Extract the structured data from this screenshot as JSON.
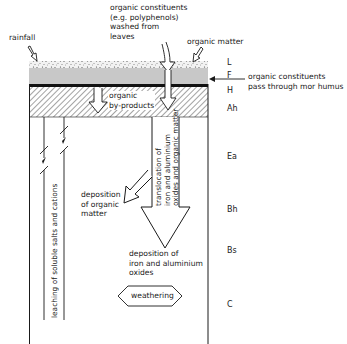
{
  "diagram": {
    "inputs": {
      "rainfall": "rainfall",
      "organic_constituents": [
        "organic constituents",
        "(e.g. polyphenols)",
        "washed from",
        "leaves"
      ],
      "organic_matter": "organic matter"
    },
    "side_note": [
      "organic constituents",
      "pass through mor humus"
    ],
    "horizons": [
      {
        "id": "L",
        "label": "L"
      },
      {
        "id": "F",
        "label": "F"
      },
      {
        "id": "H",
        "label": "H"
      },
      {
        "id": "Ah",
        "label": "Ah"
      },
      {
        "id": "Ea",
        "label": "Ea"
      },
      {
        "id": "Bh",
        "label": "Bh"
      },
      {
        "id": "Bs",
        "label": "Bs"
      },
      {
        "id": "C",
        "label": "C"
      }
    ],
    "processes": {
      "organic_byproducts": [
        "organic",
        "by-products"
      ],
      "leaching": "leaching of soluble salts and cations",
      "translocation": [
        "translocation of",
        "iron and aluminium",
        "oxides and organic matter"
      ],
      "deposition_organic": [
        "deposition",
        "of organic",
        "matter"
      ],
      "deposition_iron": [
        "deposition of",
        "iron and aluminium",
        "oxides"
      ],
      "weathering": "weathering"
    },
    "colors": {
      "line": "#1a1a1a",
      "f_layer": "#c8c8c8",
      "h_layer": "#111111",
      "hatch": "#555555",
      "background": "#ffffff"
    }
  }
}
